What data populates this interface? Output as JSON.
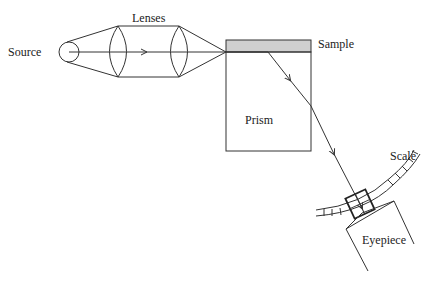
{
  "diagram": {
    "labels": {
      "source": "Source",
      "lenses": "Lenses",
      "sample": "Sample",
      "prism": "Prism",
      "scale": "Scale",
      "eyepiece": "Eyepiece"
    },
    "colors": {
      "line": "#333333",
      "sample_fill": "#cfcfcf",
      "background": "#ffffff"
    },
    "components": [
      {
        "id": "source",
        "shape": "circle"
      },
      {
        "id": "lens-1",
        "shape": "biconvex-lens"
      },
      {
        "id": "lens-2",
        "shape": "biconvex-lens"
      },
      {
        "id": "sample",
        "shape": "shaded-strip"
      },
      {
        "id": "prism",
        "shape": "rectangle"
      },
      {
        "id": "scale",
        "shape": "curved-graduated-arc"
      },
      {
        "id": "reticle",
        "shape": "square-crosshair"
      },
      {
        "id": "eyepiece",
        "shape": "tilted-tube"
      }
    ],
    "edges": [
      {
        "from": "source",
        "to": "lens-1"
      },
      {
        "from": "lens-1",
        "to": "lens-2"
      },
      {
        "from": "lens-2",
        "to": "sample"
      },
      {
        "from": "sample",
        "to": "prism"
      },
      {
        "from": "prism",
        "to": "reticle"
      },
      {
        "from": "reticle",
        "to": "eyepiece"
      }
    ]
  }
}
